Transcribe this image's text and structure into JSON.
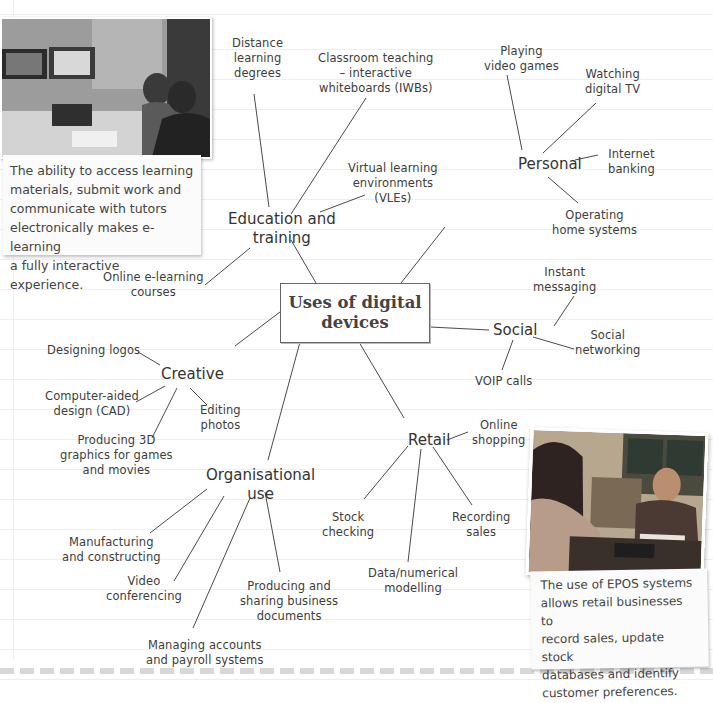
{
  "center": {
    "title_line1": "Uses of digital",
    "title_line2": "devices"
  },
  "categories": {
    "education": {
      "line1": "Education and",
      "line2": "training",
      "items": [
        {
          "lines": [
            "Distance",
            "learning",
            "degrees"
          ]
        },
        {
          "lines": [
            "Classroom teaching",
            "– interactive",
            "whiteboards (IWBs)"
          ]
        },
        {
          "lines": [
            "Virtual learning",
            "environments",
            "(VLEs)"
          ]
        },
        {
          "lines": [
            "Online e-learning",
            "courses"
          ]
        }
      ]
    },
    "personal": {
      "label": "Personal",
      "items": [
        {
          "lines": [
            "Playing",
            "video games"
          ]
        },
        {
          "lines": [
            "Watching",
            "digital TV"
          ]
        },
        {
          "lines": [
            "Internet",
            "banking"
          ]
        },
        {
          "lines": [
            "Operating",
            "home systems"
          ]
        }
      ]
    },
    "social": {
      "label": "Social",
      "items": [
        {
          "lines": [
            "Instant",
            "messaging"
          ]
        },
        {
          "lines": [
            "Social",
            "networking"
          ]
        },
        {
          "lines": [
            "VOIP calls"
          ]
        }
      ]
    },
    "creative": {
      "label": "Creative",
      "items": [
        {
          "lines": [
            "Designing logos"
          ]
        },
        {
          "lines": [
            "Computer-aided",
            "design (CAD)"
          ]
        },
        {
          "lines": [
            "Editing",
            "photos"
          ]
        },
        {
          "lines": [
            "Producing 3D",
            "graphics for games",
            "and movies"
          ]
        }
      ]
    },
    "retail": {
      "label": "Retail",
      "items": [
        {
          "lines": [
            "Online",
            "shopping"
          ]
        },
        {
          "lines": [
            "Stock",
            "checking"
          ]
        },
        {
          "lines": [
            "Recording",
            "sales"
          ]
        },
        {
          "lines": [
            "Data/numerical",
            "modelling"
          ]
        }
      ]
    },
    "organisational": {
      "line1": "Organisational",
      "line2": "use",
      "items": [
        {
          "lines": [
            "Manufacturing",
            "and constructing"
          ]
        },
        {
          "lines": [
            "Video",
            "conferencing"
          ]
        },
        {
          "lines": [
            "Producing and",
            "sharing business",
            "documents"
          ]
        },
        {
          "lines": [
            "Managing accounts",
            "and payroll systems"
          ]
        }
      ]
    }
  },
  "notes": {
    "elearning": {
      "photo_alt": "Students in a video-conferencing classroom",
      "lines": [
        "The ability to access learning",
        "materials, submit work and",
        "communicate with tutors",
        "electronically makes e-learning",
        "a fully interactive experience."
      ]
    },
    "epos": {
      "photo_alt": "Customer paying at a shop counter with EPOS terminal",
      "lines": [
        "The use of EPOS systems",
        "allows retail businesses to",
        "record sales, update stock",
        "databases and identify",
        "customer preferences."
      ]
    }
  }
}
